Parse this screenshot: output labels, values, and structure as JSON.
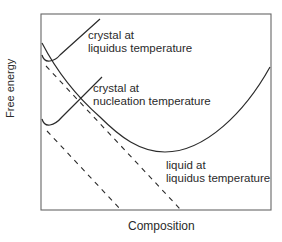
{
  "diagram": {
    "axes": {
      "y_label": "Free energy",
      "x_label": "Composition"
    },
    "curves": [
      {
        "id": "crystal-liquidus",
        "label_line1": "crystal at",
        "label_line2": "liquidus temperature",
        "style": "solid"
      },
      {
        "id": "crystal-nucleation",
        "label_line1": "crystal at",
        "label_line2": "nucleation temperature",
        "style": "solid"
      },
      {
        "id": "liquid-liquidus",
        "label_line1": "liquid at",
        "label_line2": "liquidus temperature",
        "style": "solid"
      }
    ],
    "tangent_lines": [
      {
        "id": "common-tangent-liquidus",
        "style": "dashed"
      },
      {
        "id": "common-tangent-nucleation",
        "style": "dashed"
      }
    ],
    "colors": {
      "line": "#2b2b2b",
      "frame": "#555555",
      "background": "#ffffff"
    }
  }
}
